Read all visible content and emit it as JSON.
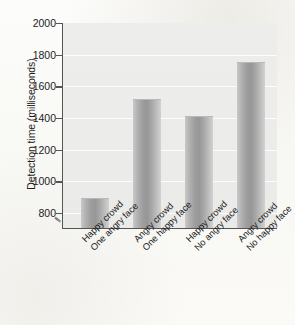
{
  "chart_data": {
    "type": "bar",
    "title": "",
    "subtitle": "",
    "xlabel": "",
    "ylabel": "Detection time (milliseconds)",
    "categories": [
      "Happy crowd One angry face",
      "Angry crowd One happy face",
      "Happy crowd No angry face",
      "Angry crowd No happy face"
    ],
    "category_lines": [
      [
        "Happy crowd",
        "One angry face"
      ],
      [
        "Angry crowd",
        "One happy face"
      ],
      [
        "Happy crowd",
        "No angry face"
      ],
      [
        "Angry crowd",
        "No happy face"
      ]
    ],
    "values": [
      880,
      1510,
      1400,
      1740
    ],
    "ylim": [
      700,
      2000
    ],
    "yticks": [
      800,
      1000,
      1200,
      1400,
      1600,
      1800,
      2000
    ],
    "ytick_labels": [
      "800",
      "1000",
      "1200",
      "1400",
      "1600",
      "1800",
      "2000"
    ],
    "grid": true,
    "axis_break": true,
    "axis_break_glyph": "//",
    "legend": "none",
    "bar_color": "#9e9e9e",
    "plot_background": "#ececeb",
    "page_background": "#fbfbf9",
    "axis_color": "#555555"
  }
}
